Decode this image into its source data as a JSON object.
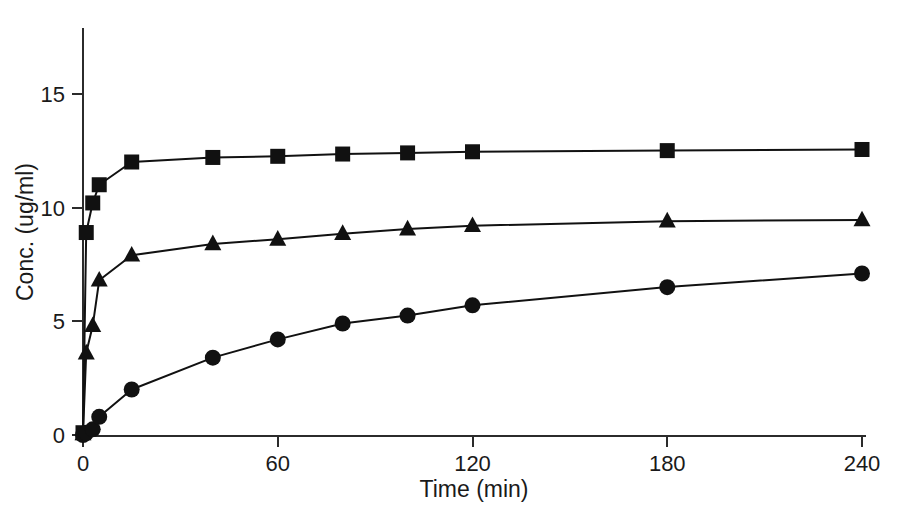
{
  "chart_data": {
    "type": "line",
    "title": "",
    "subtitle": "",
    "xlabel": "Time (min)",
    "ylabel": "Conc. (ug/ml)",
    "xlim": [
      0,
      240
    ],
    "ylim": [
      0,
      17
    ],
    "xticks": [
      0,
      60,
      120,
      180,
      240
    ],
    "yticks": [
      0,
      5,
      10,
      15
    ],
    "xtick_labels": [
      "0",
      "60",
      "120",
      "180",
      "240"
    ],
    "ytick_labels": [
      "0",
      "5",
      "10",
      "15"
    ],
    "grid": false,
    "legend": null,
    "legend_position": "none",
    "x": [
      0,
      1,
      3,
      5,
      15,
      40,
      60,
      80,
      100,
      120,
      180,
      240
    ],
    "series": [
      {
        "name": "series-square",
        "marker": "square",
        "color": "#111111",
        "values": [
          0.1,
          8.9,
          10.2,
          11.0,
          12.0,
          12.2,
          12.25,
          12.35,
          12.4,
          12.45,
          12.5,
          12.55
        ]
      },
      {
        "name": "series-triangle",
        "marker": "triangle",
        "color": "#111111",
        "values": [
          0.05,
          3.6,
          4.8,
          6.8,
          7.9,
          8.4,
          8.6,
          8.85,
          9.05,
          9.2,
          9.4,
          9.45
        ]
      },
      {
        "name": "series-circle",
        "marker": "circle",
        "color": "#111111",
        "values": [
          0.0,
          0.1,
          0.25,
          0.8,
          2.0,
          3.4,
          4.2,
          4.9,
          5.25,
          5.7,
          6.5,
          7.1
        ]
      }
    ]
  },
  "axes": {
    "y_axis_name": "y-axis",
    "x_axis_name": "x-axis"
  }
}
